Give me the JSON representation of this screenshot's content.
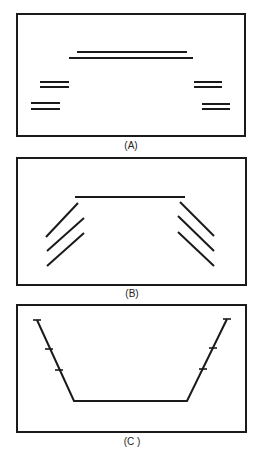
{
  "figure": {
    "panels": [
      {
        "id": "A",
        "caption": "(A)",
        "box": {
          "x": 17,
          "y": 14,
          "w": 228,
          "h": 122
        },
        "description": "Parallel line pairs: a long double line on top and short double-line pairs on each side at two levels",
        "lines": [
          {
            "x1": 77,
            "y1": 52,
            "x2": 187,
            "y2": 52
          },
          {
            "x1": 69,
            "y1": 58,
            "x2": 193,
            "y2": 58
          },
          {
            "x1": 40,
            "y1": 82,
            "x2": 69,
            "y2": 82
          },
          {
            "x1": 40,
            "y1": 87,
            "x2": 69,
            "y2": 87
          },
          {
            "x1": 31,
            "y1": 103,
            "x2": 60,
            "y2": 103
          },
          {
            "x1": 31,
            "y1": 109,
            "x2": 60,
            "y2": 109
          },
          {
            "x1": 194,
            "y1": 82,
            "x2": 222,
            "y2": 82
          },
          {
            "x1": 194,
            "y1": 87,
            "x2": 222,
            "y2": 87
          },
          {
            "x1": 202,
            "y1": 104,
            "x2": 230,
            "y2": 104
          },
          {
            "x1": 202,
            "y1": 109,
            "x2": 230,
            "y2": 109
          }
        ]
      },
      {
        "id": "B",
        "caption": "(B)",
        "box": {
          "x": 17,
          "y": 158,
          "w": 229,
          "h": 127
        },
        "description": "Horizontal top line with three parallel diagonal lines on each side",
        "lines": [
          {
            "x1": 75,
            "y1": 197,
            "x2": 185,
            "y2": 197
          },
          {
            "x1": 78,
            "y1": 203,
            "x2": 46,
            "y2": 237
          },
          {
            "x1": 84,
            "y1": 218,
            "x2": 47,
            "y2": 251
          },
          {
            "x1": 84,
            "y1": 233,
            "x2": 47,
            "y2": 266
          },
          {
            "x1": 180,
            "y1": 202,
            "x2": 214,
            "y2": 236
          },
          {
            "x1": 178,
            "y1": 216,
            "x2": 214,
            "y2": 251
          },
          {
            "x1": 178,
            "y1": 232,
            "x2": 214,
            "y2": 266
          }
        ]
      },
      {
        "id": "C",
        "caption": "(C )",
        "box": {
          "x": 17,
          "y": 305,
          "w": 229,
          "h": 127
        },
        "description": "Trapezoidal open path with tick marks along the slanted sides",
        "path": [
          [
            37,
            320
          ],
          [
            74,
            401
          ],
          [
            187,
            401
          ],
          [
            227,
            319
          ]
        ],
        "ticks": [
          {
            "x": 37,
            "y": 320
          },
          {
            "x": 49,
            "y": 349
          },
          {
            "x": 59,
            "y": 370
          },
          {
            "x": 227,
            "y": 319
          },
          {
            "x": 213,
            "y": 348
          },
          {
            "x": 203,
            "y": 369
          }
        ]
      }
    ]
  }
}
